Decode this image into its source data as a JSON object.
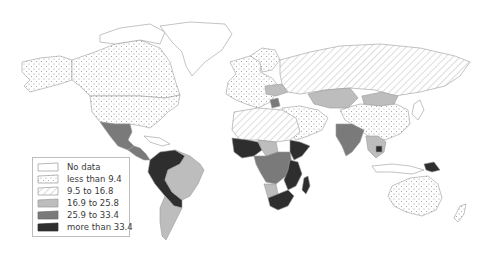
{
  "map": {
    "type": "choropleth world map",
    "projection": "equirectangular-like (Robinson style)",
    "legend": {
      "items": [
        {
          "key": "nodata",
          "label": "No data",
          "pattern": "blank",
          "color": "#ffffff"
        },
        {
          "key": "c1",
          "label": "less than 9.4",
          "pattern": "dots",
          "color": "#ffffff"
        },
        {
          "key": "c2",
          "label": "9.5 to 16.8",
          "pattern": "hatch",
          "color": "#ffffff"
        },
        {
          "key": "c3",
          "label": "16.9 to 25.8",
          "pattern": "solid",
          "color": "#bdbdbd"
        },
        {
          "key": "c4",
          "label": "25.9 to 33.4",
          "pattern": "solid",
          "color": "#7a7a7a"
        },
        {
          "key": "c5",
          "label": "more than 33.4",
          "pattern": "solid",
          "color": "#2e2e2e"
        }
      ]
    },
    "regions": [
      {
        "name": "Canada",
        "class": "c1"
      },
      {
        "name": "United States",
        "class": "c1"
      },
      {
        "name": "Alaska",
        "class": "c1"
      },
      {
        "name": "Greenland",
        "class": "nodata"
      },
      {
        "name": "Mexico",
        "class": "c4"
      },
      {
        "name": "Central America",
        "class": "c4"
      },
      {
        "name": "Colombia/Venezuela/Peru/Bolivia",
        "class": "c5"
      },
      {
        "name": "Brazil",
        "class": "c3"
      },
      {
        "name": "Argentina/Chile",
        "class": "c3"
      },
      {
        "name": "Europe",
        "class": "c1"
      },
      {
        "name": "Russia",
        "class": "c2"
      },
      {
        "name": "Kazakhstan",
        "class": "c3"
      },
      {
        "name": "Mongolia",
        "class": "c3"
      },
      {
        "name": "China",
        "class": "c1"
      },
      {
        "name": "India",
        "class": "c4"
      },
      {
        "name": "Southeast Asia",
        "class": "c3"
      },
      {
        "name": "Cambodia",
        "class": "c5"
      },
      {
        "name": "North Africa",
        "class": "c2"
      },
      {
        "name": "Middle East",
        "class": "c1"
      },
      {
        "name": "West Africa",
        "class": "c5"
      },
      {
        "name": "Central Africa",
        "class": "c4"
      },
      {
        "name": "East Africa",
        "class": "c5"
      },
      {
        "name": "Southern Africa",
        "class": "c5"
      },
      {
        "name": "Madagascar",
        "class": "c5"
      },
      {
        "name": "Australia",
        "class": "c1"
      },
      {
        "name": "Papua New Guinea",
        "class": "c5"
      },
      {
        "name": "New Zealand",
        "class": "c1"
      }
    ]
  }
}
